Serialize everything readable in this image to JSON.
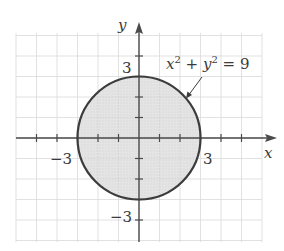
{
  "chart_data": {
    "type": "scatter",
    "title": "",
    "xlabel": "x",
    "ylabel": "y",
    "xlim": [
      -6,
      6
    ],
    "ylim": [
      -5,
      5
    ],
    "grid": true,
    "shape": "disk",
    "equation": "x^2 + y^2 = 9",
    "center": [
      0,
      0
    ],
    "radius": 3,
    "region_shaded": "interior",
    "x_tick_labels": [
      "-3",
      "3"
    ],
    "y_tick_labels": [
      "3",
      "-3"
    ],
    "x_ticks": [
      -5,
      -4,
      -3,
      -2,
      -1,
      1,
      2,
      3,
      4,
      5
    ],
    "y_ticks": [
      -4,
      -3,
      -2,
      -1,
      1,
      2,
      3,
      4
    ]
  },
  "labels": {
    "x_axis": "x",
    "y_axis": "y",
    "x_neg3": "−3",
    "x_pos3": "3",
    "y_pos3": "3",
    "y_neg3": "−3",
    "eq_x": "x",
    "eq_plus": " + ",
    "eq_y": "y",
    "eq_exp": "2",
    "eq_rhs": " = 9"
  },
  "colors": {
    "fill": "#e6e6e6",
    "stroke": "#3c3c3c",
    "grid": "#d9d9d9",
    "axis": "#4a4a4a"
  }
}
